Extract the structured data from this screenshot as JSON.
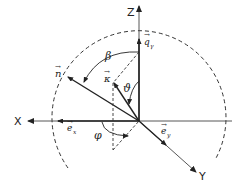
{
  "diagram": {
    "type": "3d-coordinate-vector-diagram",
    "colors": {
      "ink": "#222222",
      "background": "#ffffff"
    },
    "axes": {
      "x": {
        "label": "X"
      },
      "y": {
        "label": "Y"
      },
      "z": {
        "label": "Z"
      }
    },
    "vectors": [
      {
        "id": "n",
        "label": "n",
        "arrow": "→"
      },
      {
        "id": "kappa",
        "label": "κ",
        "arrow": "→"
      },
      {
        "id": "q",
        "label": "q",
        "subscript": "γ",
        "arrow": "→"
      },
      {
        "id": "ex",
        "label": "e",
        "subscript": "x",
        "arrow": "→"
      },
      {
        "id": "ey",
        "label": "e",
        "subscript": "y",
        "arrow": "→"
      }
    ],
    "angles": [
      {
        "id": "beta",
        "label": "β",
        "between": "Z-axis and n"
      },
      {
        "id": "theta",
        "label": "ϑ",
        "between": "Z-axis and κ"
      },
      {
        "id": "phi",
        "label": "φ",
        "between": "X-axis and projection of κ"
      }
    ],
    "guides": {
      "sphere": "dashed circle",
      "projection": "dashed lines projecting κ onto XY plane"
    }
  }
}
